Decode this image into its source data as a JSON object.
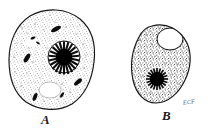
{
  "figure": {
    "type": "scientific-line-illustration",
    "medium": "stipple pen-and-ink drawing",
    "background_color": "#ffffff",
    "ink_color": "#1a1a1a",
    "stipple_color": "#2b2b2b",
    "artist_signature": "ECF",
    "cells": [
      {
        "id": "A",
        "label": "A",
        "label_style": "italic-serif-bold",
        "description": "Large rounded polygonal cell with densely stippled cytoplasm, several dark elongated granules, one pale vacuole, and a large nucleus with a dense dark nucleolus ringed by radial spokes",
        "outline_center_x": 52,
        "outline_center_y": 59,
        "outline_width": 88,
        "outline_height": 102,
        "nucleus": {
          "center_x": 64,
          "center_y": 57,
          "radius": 16,
          "nucleolus_radius": 8,
          "radial_spokes": 22,
          "fill": "#000000"
        },
        "vacuole": {
          "center_x": 50,
          "center_y": 90,
          "radius_x": 11,
          "radius_y": 8,
          "fill": "#ffffff"
        },
        "granules": 6
      },
      {
        "id": "B",
        "label": "B",
        "label_style": "italic-serif-bold",
        "description": "Smaller ovoid cell with coarse stippled cytoplasm, a large clear round vacuole in the upper region, and a dark round nucleus with radial spokes in the lower region",
        "outline_center_x": 161,
        "outline_center_y": 64,
        "outline_width": 57,
        "outline_height": 79,
        "nucleus": {
          "center_x": 157,
          "center_y": 79,
          "radius": 11,
          "nucleolus_radius": 7,
          "radial_spokes": 20,
          "fill": "#000000"
        },
        "vacuole": {
          "center_x": 170,
          "center_y": 39,
          "radius_x": 13,
          "radius_y": 11,
          "fill": "#ffffff"
        },
        "granules": 0
      }
    ]
  }
}
